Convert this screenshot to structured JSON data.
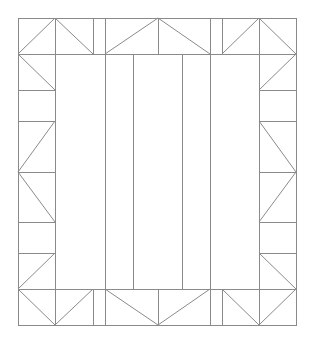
{
  "diagram": {
    "type": "quilt-block-line-drawing",
    "stroke_color": "#8a8a8a",
    "background": "#ffffff",
    "outer_border": {
      "x1": 18,
      "y1": 18,
      "x2": 296,
      "y2": 325
    },
    "horizontals": [
      {
        "x1": 18,
        "y1": 54,
        "x2": 296,
        "y2": 54
      },
      {
        "x1": 18,
        "y1": 289,
        "x2": 296,
        "y2": 289
      },
      {
        "x1": 18,
        "y1": 90,
        "x2": 55,
        "y2": 90
      },
      {
        "x1": 18,
        "y1": 121,
        "x2": 55,
        "y2": 121
      },
      {
        "x1": 18,
        "y1": 172,
        "x2": 55,
        "y2": 172
      },
      {
        "x1": 18,
        "y1": 222,
        "x2": 55,
        "y2": 222
      },
      {
        "x1": 18,
        "y1": 253,
        "x2": 55,
        "y2": 253
      },
      {
        "x1": 259,
        "y1": 90,
        "x2": 296,
        "y2": 90
      },
      {
        "x1": 259,
        "y1": 121,
        "x2": 296,
        "y2": 121
      },
      {
        "x1": 259,
        "y1": 172,
        "x2": 296,
        "y2": 172
      },
      {
        "x1": 259,
        "y1": 222,
        "x2": 296,
        "y2": 222
      },
      {
        "x1": 259,
        "y1": 253,
        "x2": 296,
        "y2": 253
      }
    ],
    "verticals": [
      {
        "x1": 55,
        "y1": 18,
        "x2": 55,
        "y2": 325
      },
      {
        "x1": 259,
        "y1": 18,
        "x2": 259,
        "y2": 325
      },
      {
        "x1": 93,
        "y1": 18,
        "x2": 93,
        "y2": 54
      },
      {
        "x1": 93,
        "y1": 289,
        "x2": 93,
        "y2": 325
      },
      {
        "x1": 222,
        "y1": 18,
        "x2": 222,
        "y2": 54
      },
      {
        "x1": 222,
        "y1": 289,
        "x2": 222,
        "y2": 325
      },
      {
        "x1": 105,
        "y1": 18,
        "x2": 105,
        "y2": 325
      },
      {
        "x1": 210,
        "y1": 18,
        "x2": 210,
        "y2": 325
      },
      {
        "x1": 158,
        "y1": 18,
        "x2": 158,
        "y2": 54
      },
      {
        "x1": 158,
        "y1": 289,
        "x2": 158,
        "y2": 325
      },
      {
        "x1": 133,
        "y1": 54,
        "x2": 133,
        "y2": 289
      },
      {
        "x1": 182,
        "y1": 54,
        "x2": 182,
        "y2": 289
      }
    ],
    "diagonals": [
      {
        "x1": 18,
        "y1": 54,
        "x2": 55,
        "y2": 18
      },
      {
        "x1": 55,
        "y1": 18,
        "x2": 93,
        "y2": 54
      },
      {
        "x1": 105,
        "y1": 54,
        "x2": 158,
        "y2": 18
      },
      {
        "x1": 158,
        "y1": 18,
        "x2": 210,
        "y2": 54
      },
      {
        "x1": 222,
        "y1": 54,
        "x2": 259,
        "y2": 18
      },
      {
        "x1": 259,
        "y1": 18,
        "x2": 296,
        "y2": 54
      },
      {
        "x1": 18,
        "y1": 289,
        "x2": 55,
        "y2": 325
      },
      {
        "x1": 55,
        "y1": 325,
        "x2": 93,
        "y2": 289
      },
      {
        "x1": 105,
        "y1": 289,
        "x2": 158,
        "y2": 325
      },
      {
        "x1": 158,
        "y1": 325,
        "x2": 210,
        "y2": 289
      },
      {
        "x1": 222,
        "y1": 289,
        "x2": 259,
        "y2": 325
      },
      {
        "x1": 259,
        "y1": 325,
        "x2": 296,
        "y2": 289
      },
      {
        "x1": 18,
        "y1": 54,
        "x2": 55,
        "y2": 90
      },
      {
        "x1": 55,
        "y1": 121,
        "x2": 18,
        "y2": 172
      },
      {
        "x1": 18,
        "y1": 172,
        "x2": 55,
        "y2": 222
      },
      {
        "x1": 55,
        "y1": 253,
        "x2": 18,
        "y2": 289
      },
      {
        "x1": 296,
        "y1": 54,
        "x2": 259,
        "y2": 90
      },
      {
        "x1": 259,
        "y1": 121,
        "x2": 296,
        "y2": 172
      },
      {
        "x1": 296,
        "y1": 172,
        "x2": 259,
        "y2": 222
      },
      {
        "x1": 259,
        "y1": 253,
        "x2": 296,
        "y2": 289
      }
    ]
  }
}
